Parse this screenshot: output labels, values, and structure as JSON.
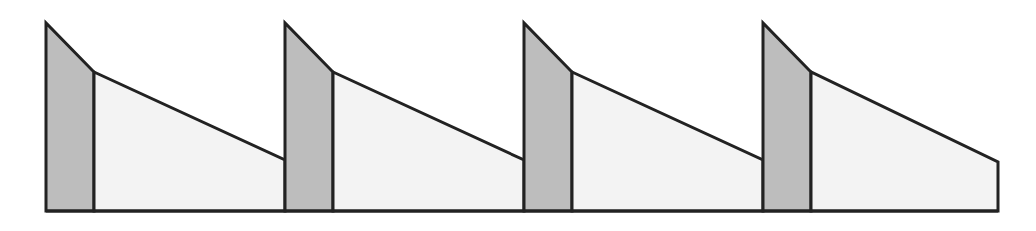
{
  "diagram": {
    "type": "sawtooth-profile",
    "width": 1036,
    "height": 231,
    "baseline_y": 211,
    "colors": {
      "background": "#ffffff",
      "stroke": "#222222",
      "dark_fill": "#bdbdbd",
      "light_fill": "#f3f3f3"
    },
    "stroke_width": 3,
    "segments": [
      {
        "x_start": 46,
        "x_divider": 94,
        "x_end": 285,
        "peak_y": 23,
        "kink_y": 72,
        "end_y": 160
      },
      {
        "x_start": 285,
        "x_divider": 333,
        "x_end": 524,
        "peak_y": 23,
        "kink_y": 72,
        "end_y": 160
      },
      {
        "x_start": 524,
        "x_divider": 572,
        "x_end": 763,
        "peak_y": 23,
        "kink_y": 72,
        "end_y": 160
      },
      {
        "x_start": 763,
        "x_divider": 811,
        "x_end": 998,
        "peak_y": 23,
        "kink_y": 72,
        "end_y": 162
      }
    ]
  }
}
